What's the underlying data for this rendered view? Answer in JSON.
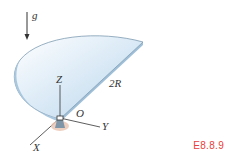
{
  "labels": {
    "gravity": "g",
    "z_axis": "Z",
    "y_axis": "Y",
    "x_axis": "X",
    "origin": "O",
    "radius": "2R"
  },
  "figure_id": "E8.8.9",
  "colors": {
    "plate_fill": "#cfe3f2",
    "plate_edge": "#8fb3cf",
    "support": "#7f96a8",
    "support_shadow": "#e9c3b0",
    "figure_id": "#e8403a"
  }
}
